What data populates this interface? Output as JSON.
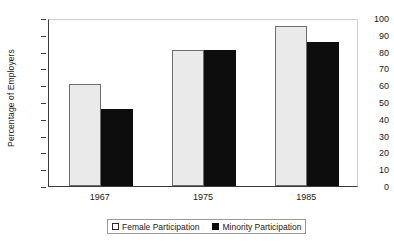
{
  "chart_data": {
    "type": "bar",
    "title": "",
    "subtitle": "",
    "xlabel": "",
    "ylabel": "Percentage of Employers",
    "categories": [
      "1967",
      "1975",
      "1985"
    ],
    "series": [
      {
        "name": "Female Participation",
        "color": "#eaeaea",
        "values": [
          61,
          81,
          95
        ]
      },
      {
        "name": "Minority Participation",
        "color": "#0d0d0d",
        "values": [
          46,
          81,
          86
        ]
      }
    ],
    "ylim": [
      0,
      100
    ],
    "ytick_step": 10,
    "yticks": [
      "100",
      "90",
      "80",
      "70",
      "60",
      "50",
      "40",
      "30",
      "20",
      "10",
      "0"
    ],
    "grid": false,
    "legend_position": "bottom"
  },
  "legend": {
    "items": [
      {
        "label": "Female Participation",
        "swatch": "open-square-swatch"
      },
      {
        "label": "Minority Participation",
        "swatch": "filled-square-swatch"
      }
    ]
  }
}
